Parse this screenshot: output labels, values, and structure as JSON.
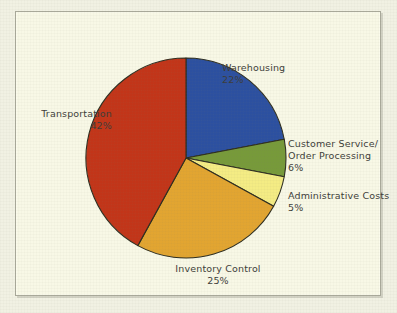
{
  "chart_data": {
    "type": "pie",
    "title": "",
    "subtitle": "",
    "xlabel": "",
    "ylabel": "",
    "legend_position": "none",
    "grid": false,
    "labels_inline": true,
    "start_angle_deg": 0,
    "direction": "clockwise",
    "categories": [
      "Warehousing",
      "Customer Service/ Order Processing",
      "Administrative Costs",
      "Inventory Control",
      "Transportation"
    ],
    "values": [
      22,
      6,
      5,
      25,
      42
    ],
    "unit": "%",
    "total": 100,
    "slices": [
      {
        "name": "Warehousing",
        "label_line1": "Warehousing",
        "label_line2": "",
        "value": 22,
        "value_text": "22%",
        "color": "#2c50a0"
      },
      {
        "name": "Customer Service/ Order Processing",
        "label_line1": "Customer Service/",
        "label_line2": "Order Processing",
        "value": 6,
        "value_text": "6%",
        "color": "#779a3a"
      },
      {
        "name": "Administrative Costs",
        "label_line1": "Administrative Costs",
        "label_line2": "",
        "value": 5,
        "value_text": "5%",
        "color": "#f4ec84"
      },
      {
        "name": "Inventory Control",
        "label_line1": "Inventory Control",
        "label_line2": "",
        "value": 25,
        "value_text": "25%",
        "color": "#e2a531"
      },
      {
        "name": "Transportation",
        "label_line1": "Transportation",
        "label_line2": "",
        "value": 42,
        "value_text": "42%",
        "color": "#c23519"
      }
    ]
  },
  "figure": {
    "panel_background": "#f8f8e6",
    "page_background": "#f1f1e3",
    "border_color": "#a9a99a",
    "text_color": "#3d3d39",
    "slice_outline_color": "#2e2e20",
    "center_x": 186,
    "center_y": 158,
    "radius": 100
  },
  "labels": {
    "transportation": {
      "name": "Transportation",
      "pct": "42%"
    },
    "warehousing": {
      "name": "Warehousing",
      "pct": "22%"
    },
    "customer": {
      "line1": "Customer Service/",
      "line2": "Order Processing",
      "pct": "6%"
    },
    "admin": {
      "name": "Administrative Costs",
      "pct": "5%"
    },
    "inventory": {
      "name": "Inventory Control",
      "pct": "25%"
    }
  }
}
